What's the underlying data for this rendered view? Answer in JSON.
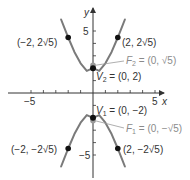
{
  "diagram": {
    "type": "hyperbola",
    "equation": "y^2/4 - x^2/1 = 1",
    "axes": {
      "x_label": "x",
      "y_label": "y",
      "x_ticks": {
        "min_label": "−5",
        "max_label": "5"
      },
      "y_ticks": {
        "max_label": "5",
        "min_label": "−5"
      },
      "range": [
        -5,
        5
      ]
    },
    "colors": {
      "curve": "#7a7a7a",
      "axis": "#333333",
      "point": "#111111",
      "focus_point": "#9a9a9a",
      "focus_label": "#8a8a8a"
    },
    "points": [
      {
        "name": "top-left",
        "label": "(−2, 2√5)",
        "x": -2,
        "y": 4.472
      },
      {
        "name": "top-right",
        "label": "(2, 2√5)",
        "x": 2,
        "y": 4.472
      },
      {
        "name": "bottom-left",
        "label": "(−2, −2√5)",
        "x": -2,
        "y": -4.472
      },
      {
        "name": "bottom-right",
        "label": "(2, −2√5)",
        "x": 2,
        "y": -4.472
      }
    ],
    "vertices": [
      {
        "name": "V2",
        "label_prefix": "V",
        "sub": "2",
        "label_value": " = (0, 2)",
        "x": 0,
        "y": 2
      },
      {
        "name": "V1",
        "label_prefix": "V",
        "sub": "1",
        "label_value": " = (0, −2)",
        "x": 0,
        "y": -2
      }
    ],
    "foci": [
      {
        "name": "F2",
        "label_prefix": "F",
        "sub": "2",
        "label_value": " = (0, √5)",
        "x": 0,
        "y": 2.236
      },
      {
        "name": "F1",
        "label_prefix": "F",
        "sub": "1",
        "label_value": " = (0, −√5)",
        "x": 0,
        "y": -2.236
      }
    ]
  }
}
